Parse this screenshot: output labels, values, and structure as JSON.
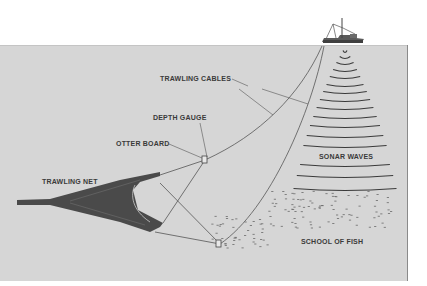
{
  "diagram": {
    "colors": {
      "background": "#ffffff",
      "water": "#d6d6d6",
      "line": "#555555",
      "net": "#4a4a4a",
      "label": "#3a3a3a"
    },
    "labels": {
      "trawling_cables": "TRAWLING CABLES",
      "depth_gauge": "DEPTH GAUGE",
      "otter_board": "OTTER BOARD",
      "trawling_net": "TRAWLING NET",
      "sonar_waves": "SONAR WAVES",
      "school_of_fish": "SCHOOL OF FISH"
    },
    "elements": [
      "trawler-ship",
      "trawling-cables",
      "otter-boards",
      "trawling-net",
      "sonar-waves",
      "school-of-fish",
      "depth-gauge"
    ]
  }
}
